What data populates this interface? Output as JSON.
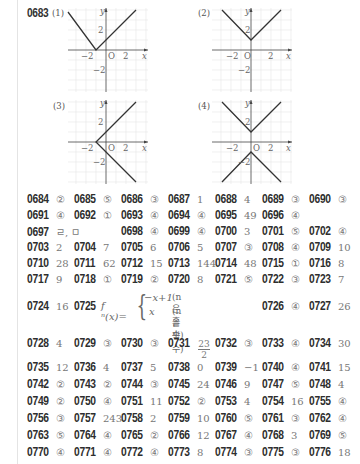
{
  "problem_0683": {
    "number": "0683",
    "graphs": [
      {
        "label": "(1)",
        "equation": "y=|x+1|",
        "vertex": [
          -1,
          0
        ],
        "ticks": {
          "x": [
            "-2",
            "2"
          ],
          "y": [
            "2",
            "-2"
          ]
        },
        "axis_labels": {
          "x": "x",
          "y": "y",
          "origin": "O"
        }
      },
      {
        "label": "(2)",
        "equation": "y=|x|+1",
        "vertex": [
          0,
          1
        ],
        "ticks": {
          "x": [
            "-2",
            "2"
          ],
          "y": [
            "2",
            "-2"
          ]
        },
        "axis_labels": {
          "x": "x",
          "y": "y",
          "origin": "O"
        }
      },
      {
        "label": "(3)",
        "equation": "x=|y|-1",
        "vertex": [
          -1,
          0
        ],
        "ticks": {
          "x": [
            "-2",
            "2"
          ],
          "y": [
            "2",
            "-2"
          ]
        },
        "axis_labels": {
          "x": "x",
          "y": "y",
          "origin": "O"
        }
      },
      {
        "label": "(4)",
        "equation": "|y|=|x|+1",
        "vertex": [
          [
            0,
            1
          ],
          [
            0,
            -1
          ]
        ],
        "ticks": {
          "x": [
            "-2",
            "2"
          ],
          "y": [
            "2",
            "-2"
          ]
        },
        "axis_labels": {
          "x": "x",
          "y": "y",
          "origin": "O"
        }
      }
    ]
  },
  "answers": [
    [
      {
        "n": "0684",
        "a": "②"
      },
      {
        "n": "0685",
        "a": "⑤"
      },
      {
        "n": "0686",
        "a": "③"
      },
      {
        "n": "0687",
        "a": "1"
      },
      {
        "n": "0688",
        "a": "4"
      },
      {
        "n": "0689",
        "a": "③"
      },
      {
        "n": "0690",
        "a": "③"
      }
    ],
    [
      {
        "n": "0691",
        "a": "④"
      },
      {
        "n": "0692",
        "a": "①"
      },
      {
        "n": "0693",
        "a": "④"
      },
      {
        "n": "0694",
        "a": "④"
      },
      {
        "n": "0695",
        "a": "49"
      },
      {
        "n": "0696",
        "a": "④"
      }
    ],
    [
      {
        "n": "0697",
        "a": "ㄹ, ㅁ"
      },
      {
        "n": "0698",
        "a": "④"
      },
      {
        "n": "0699",
        "a": "④"
      },
      {
        "n": "0700",
        "a": "3"
      },
      {
        "n": "0701",
        "a": "⑤"
      },
      {
        "n": "0702",
        "a": "④"
      }
    ],
    [
      {
        "n": "0703",
        "a": "2"
      },
      {
        "n": "0704",
        "a": "7"
      },
      {
        "n": "0705",
        "a": "6"
      },
      {
        "n": "0706",
        "a": "5"
      },
      {
        "n": "0707",
        "a": "③"
      },
      {
        "n": "0708",
        "a": "④"
      },
      {
        "n": "0709",
        "a": "10"
      }
    ],
    [
      {
        "n": "0710",
        "a": "28"
      },
      {
        "n": "0711",
        "a": "62"
      },
      {
        "n": "0712",
        "a": "15"
      },
      {
        "n": "0713",
        "a": "144"
      },
      {
        "n": "0714",
        "a": "48"
      },
      {
        "n": "0715",
        "a": "①"
      },
      {
        "n": "0716",
        "a": "8"
      }
    ],
    [
      {
        "n": "0717",
        "a": "9"
      },
      {
        "n": "0718",
        "a": "①"
      },
      {
        "n": "0719",
        "a": "②"
      },
      {
        "n": "0720",
        "a": "8"
      },
      {
        "n": "0721",
        "a": "⑤"
      },
      {
        "n": "0722",
        "a": "③"
      },
      {
        "n": "0723",
        "a": "7"
      }
    ]
  ],
  "row_0724": {
    "items": [
      {
        "n": "0724",
        "a": "16"
      },
      {
        "n": "0725",
        "a": ""
      },
      {
        "n": "0726",
        "a": "④"
      },
      {
        "n": "0727",
        "a": "26"
      }
    ],
    "piecewise": {
      "lhs": "f ⁿ(x)=",
      "case1_expr": "−x+1",
      "case1_cond": "(n은 홀수)",
      "case2_expr": "x",
      "case2_cond": "(n은 짝수)"
    }
  },
  "row_0728": {
    "items": [
      {
        "n": "0728",
        "a": "4"
      },
      {
        "n": "0729",
        "a": "③"
      },
      {
        "n": "0730",
        "a": "③"
      },
      {
        "n": "0731",
        "a": ""
      },
      {
        "n": "0732",
        "a": "③"
      },
      {
        "n": "0733",
        "a": "④"
      },
      {
        "n": "0734",
        "a": "30"
      }
    ],
    "fraction_0731": {
      "numerator": "23",
      "denominator": "2"
    }
  },
  "answers_tail": [
    [
      {
        "n": "0735",
        "a": "12"
      },
      {
        "n": "0736",
        "a": "4"
      },
      {
        "n": "0737",
        "a": "5"
      },
      {
        "n": "0738",
        "a": "0"
      },
      {
        "n": "0739",
        "a": "−1"
      },
      {
        "n": "0740",
        "a": "④"
      },
      {
        "n": "0741",
        "a": "15"
      }
    ],
    [
      {
        "n": "0742",
        "a": "②"
      },
      {
        "n": "0743",
        "a": "②"
      },
      {
        "n": "0744",
        "a": "③"
      },
      {
        "n": "0745",
        "a": "24"
      },
      {
        "n": "0746",
        "a": "9"
      },
      {
        "n": "0747",
        "a": "⑤"
      },
      {
        "n": "0748",
        "a": "4"
      }
    ],
    [
      {
        "n": "0749",
        "a": "②"
      },
      {
        "n": "0750",
        "a": "④"
      },
      {
        "n": "0751",
        "a": "11"
      },
      {
        "n": "0752",
        "a": "②"
      },
      {
        "n": "0753",
        "a": "4"
      },
      {
        "n": "0754",
        "a": "16"
      },
      {
        "n": "0755",
        "a": "④"
      }
    ],
    [
      {
        "n": "0756",
        "a": "③"
      },
      {
        "n": "0757",
        "a": "243"
      },
      {
        "n": "0758",
        "a": "2"
      },
      {
        "n": "0759",
        "a": "10"
      },
      {
        "n": "0760",
        "a": "⑤"
      },
      {
        "n": "0761",
        "a": "③"
      },
      {
        "n": "0762",
        "a": "④"
      }
    ],
    [
      {
        "n": "0763",
        "a": "⑤"
      },
      {
        "n": "0764",
        "a": "④"
      },
      {
        "n": "0765",
        "a": "②"
      },
      {
        "n": "0766",
        "a": "12"
      },
      {
        "n": "0767",
        "a": "④"
      },
      {
        "n": "0768",
        "a": "3"
      },
      {
        "n": "0769",
        "a": "⑤"
      }
    ],
    [
      {
        "n": "0770",
        "a": "④"
      },
      {
        "n": "0771",
        "a": "④"
      },
      {
        "n": "0772",
        "a": "④"
      },
      {
        "n": "0773",
        "a": "8"
      },
      {
        "n": "0774",
        "a": "③"
      },
      {
        "n": "0775",
        "a": "③"
      },
      {
        "n": "0776",
        "a": "18"
      }
    ]
  ]
}
